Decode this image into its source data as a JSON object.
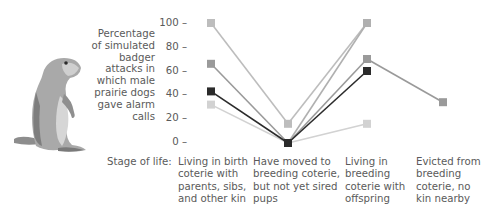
{
  "chart_data": {
    "type": "line",
    "title": "",
    "ylabel": "Percentage of simulated badger attacks in which male prairie dogs gave alarm calls",
    "ylabel_lines": [
      "Percentage",
      "of simulated",
      "badger",
      "attacks in",
      "which male",
      "prairie dogs",
      "gave alarm",
      "calls"
    ],
    "xlabel": "Stage of life:",
    "ylim": [
      0,
      100
    ],
    "yticks": [
      0,
      20,
      40,
      60,
      80,
      100
    ],
    "ytick_labels": [
      "0 –",
      "20 –",
      "40 –",
      "60 –",
      "80 –",
      "100 –"
    ],
    "grid": false,
    "legend": null,
    "categories": [
      "Living in birth coterie with parents, sibs, and other kin",
      "Have moved to breeding coterie, but not yet sired pups",
      "Living in breeding coterie with offspring",
      "Evicted from breeding coterie, no kin nearby"
    ],
    "category_lines": [
      [
        "Living in birth",
        "coterie with",
        "parents, sibs,",
        "and other kin"
      ],
      [
        "Have moved to",
        "breeding coterie,",
        "but not yet sired",
        "pups"
      ],
      [
        "Living in",
        "breeding",
        "coterie with",
        "offspring"
      ],
      [
        "Evicted from",
        "breeding",
        "coterie, no",
        "kin nearby"
      ]
    ],
    "series": [
      {
        "name": "Male A",
        "color": "#bdbdbd",
        "values": [
          100,
          16,
          100,
          null
        ]
      },
      {
        "name": "Male B",
        "color": "#9a9a9a",
        "values": [
          66,
          0,
          70,
          34
        ]
      },
      {
        "name": "Male C",
        "color": "#2b2b2b",
        "values": [
          43,
          0,
          60,
          null
        ]
      },
      {
        "name": "Male D",
        "color": "#d2d2d2",
        "values": [
          32,
          0,
          16,
          null
        ]
      },
      {
        "name": "Male E",
        "color": "#b0b0b0",
        "values": [
          null,
          0,
          100,
          null
        ]
      }
    ]
  },
  "illustration": {
    "subject": "prairie dog standing upright"
  }
}
